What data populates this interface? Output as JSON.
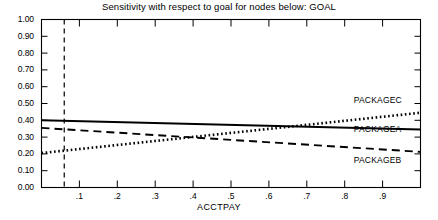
{
  "chart_data": {
    "type": "line",
    "title": "Sensitivity with respect to goal for nodes below:  GOAL",
    "xlabel": "ACCTPAY",
    "ylabel": "",
    "xlim": [
      0.0,
      1.0
    ],
    "ylim": [
      0.0,
      1.0
    ],
    "grid": false,
    "legend_position": "right-inline",
    "x_ticks": [
      0.1,
      0.2,
      0.3,
      0.4,
      0.5,
      0.6,
      0.7,
      0.8,
      0.9
    ],
    "x_tick_labels": [
      ".1",
      ".2",
      ".3",
      ".4",
      ".5",
      ".6",
      ".7",
      ".8",
      ".9"
    ],
    "y_ticks": [
      0.0,
      0.1,
      0.2,
      0.3,
      0.4,
      0.5,
      0.6,
      0.7,
      0.8,
      0.9,
      1.0
    ],
    "y_tick_labels": [
      "0.00",
      "0.10",
      "0.20",
      "0.30",
      "0.40",
      "0.50",
      "0.60",
      "0.70",
      "0.80",
      "0.90",
      "1.00"
    ],
    "annotations": [
      {
        "name": "current-value-line",
        "type": "vline",
        "x": 0.06,
        "style": "dashed"
      }
    ],
    "series": [
      {
        "name": "PACKAGEC",
        "style": "dotted",
        "x": [
          0.0,
          1.0
        ],
        "values": [
          0.205,
          0.445
        ],
        "label_x": 0.845,
        "label_y": 0.515
      },
      {
        "name": "PACKAGEA",
        "style": "solid",
        "x": [
          0.0,
          1.0
        ],
        "values": [
          0.4,
          0.345
        ],
        "label_x": 0.845,
        "label_y": 0.345
      },
      {
        "name": "PACKAGEB",
        "style": "dashed",
        "x": [
          0.0,
          1.0
        ],
        "values": [
          0.355,
          0.212
        ],
        "label_x": 0.845,
        "label_y": 0.155
      }
    ]
  }
}
